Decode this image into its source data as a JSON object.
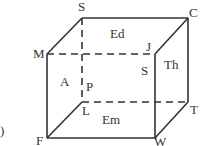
{
  "diagram": {
    "type": "cube",
    "stroke_color": "#333333",
    "vertices": {
      "S": {
        "x": 82,
        "y": 18
      },
      "C": {
        "x": 188,
        "y": 18
      },
      "M": {
        "x": 47,
        "y": 54
      },
      "J": {
        "x": 155,
        "y": 54
      },
      "L": {
        "x": 82,
        "y": 102
      },
      "T": {
        "x": 188,
        "y": 102
      },
      "F": {
        "x": 47,
        "y": 138
      },
      "W": {
        "x": 155,
        "y": 138
      }
    },
    "vertex_labels": [
      {
        "id": "S",
        "text": "S",
        "x": 78,
        "y": 0
      },
      {
        "id": "C",
        "text": "C",
        "x": 189,
        "y": 6
      },
      {
        "id": "M",
        "text": "M",
        "x": 33,
        "y": 47
      },
      {
        "id": "J",
        "text": "J",
        "x": 146,
        "y": 40
      },
      {
        "id": "P",
        "text": "P",
        "x": 86,
        "y": 80
      },
      {
        "id": "L",
        "text": "L",
        "x": 82,
        "y": 104
      },
      {
        "id": "T",
        "text": "T",
        "x": 190,
        "y": 103
      },
      {
        "id": "F",
        "text": "F",
        "x": 36,
        "y": 134
      },
      {
        "id": "W",
        "text": "W",
        "x": 154,
        "y": 135
      }
    ],
    "face_labels": [
      {
        "id": "Ed",
        "text": "Ed",
        "x": 110,
        "y": 27
      },
      {
        "id": "A",
        "text": "A",
        "x": 60,
        "y": 75
      },
      {
        "id": "S_face",
        "text": "S",
        "x": 141,
        "y": 64
      },
      {
        "id": "Th",
        "text": "Th",
        "x": 164,
        "y": 58
      },
      {
        "id": "Em",
        "text": "Em",
        "x": 102,
        "y": 113
      }
    ],
    "solid_edges": [
      [
        "S",
        "C"
      ],
      [
        "C",
        "T"
      ],
      [
        "S",
        "M"
      ],
      [
        "C",
        "J"
      ],
      [
        "T",
        "W"
      ],
      [
        "L",
        "F"
      ],
      [
        "M",
        "F"
      ],
      [
        "F",
        "W"
      ],
      [
        "J",
        "W"
      ]
    ],
    "dashed_edges": [
      [
        "M",
        "J"
      ],
      [
        "S",
        "L"
      ],
      [
        "L",
        "T"
      ]
    ],
    "partial_label": {
      "text": ")",
      "x": 0,
      "y": 124
    }
  }
}
